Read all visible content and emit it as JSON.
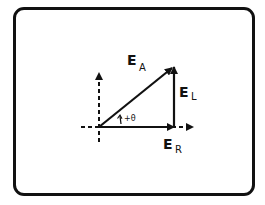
{
  "diagram": {
    "type": "phasor-diagram",
    "vectors": {
      "ea": {
        "label": "E",
        "subscript": "A"
      },
      "el": {
        "label": "E",
        "subscript": "L"
      },
      "er": {
        "label": "E",
        "subscript": "R"
      }
    },
    "angle": {
      "label": "+θ"
    },
    "colors": {
      "stroke": "#111111",
      "background": "#ffffff"
    }
  }
}
